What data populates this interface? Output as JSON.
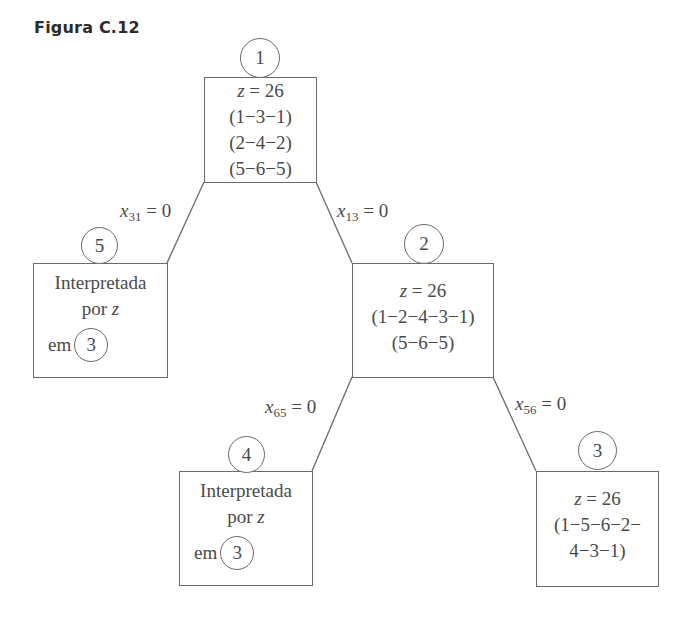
{
  "figure": {
    "title": "Figura C.12"
  },
  "nodes": {
    "n1": {
      "id": "1",
      "z": "= 26",
      "tours": [
        "(1−3−1)",
        "(2−4−2)",
        "(5−6−5)"
      ]
    },
    "n2": {
      "id": "2",
      "z": "= 26",
      "tours": [
        "(1−2−4−3−1)",
        "(5−6−5)"
      ]
    },
    "n3": {
      "id": "3",
      "z": "= 26",
      "tours": [
        "(1−5−6−2−",
        "4−3−1)"
      ]
    },
    "n4": {
      "id": "4",
      "status": "Interpretada",
      "by": "por",
      "byvar": "z",
      "in": "em",
      "ref": "3"
    },
    "n5": {
      "id": "5",
      "status": "Interpretada",
      "by": "por",
      "byvar": "z",
      "in": "em",
      "ref": "3"
    }
  },
  "z_var": "z",
  "edges": [
    {
      "from": "1",
      "to": "5",
      "var": "x",
      "sub": "31",
      "cond": "= 0"
    },
    {
      "from": "1",
      "to": "2",
      "var": "x",
      "sub": "13",
      "cond": "= 0"
    },
    {
      "from": "2",
      "to": "4",
      "var": "x",
      "sub": "65",
      "cond": "= 0"
    },
    {
      "from": "2",
      "to": "3",
      "var": "x",
      "sub": "56",
      "cond": "= 0"
    }
  ],
  "colors": {
    "stroke": "#6a6a6a",
    "text": "#4a4a4a",
    "title": "#2b2b2b"
  }
}
